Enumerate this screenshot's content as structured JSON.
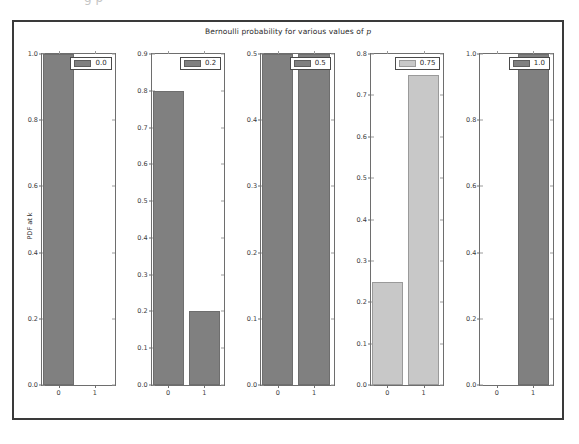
{
  "figure": {
    "title_prefix": "Bernoulli probability for various values of ",
    "title_italic": "p",
    "ylabel": "PDF at k",
    "clipped_top_text": "g p",
    "frame_color": "#3a3a3a",
    "axis_color": "#6e6e6e",
    "bar_color_dark": "#808080",
    "bar_color_light": "#c8c8c8",
    "background": "#ffffff"
  },
  "chart_data": {
    "type": "bar",
    "title": "Bernoulli probability for various values of p",
    "xlabel": "",
    "ylabel": "PDF at k",
    "grid": false,
    "legend_position": "upper right",
    "layout": "1 row x 5 columns of subplots",
    "categories": [
      "0",
      "1"
    ],
    "panels": [
      {
        "legend": "0.0",
        "p": 0.0,
        "categories": [
          "0",
          "1"
        ],
        "values": [
          1.0,
          0.0
        ],
        "ylim": [
          0.0,
          1.0
        ],
        "yticks": [
          "0.0",
          "0.2",
          "0.4",
          "0.6",
          "0.8",
          "1.0"
        ],
        "ytick_values": [
          0.0,
          0.2,
          0.4,
          0.6,
          0.8,
          1.0
        ],
        "xticks": [
          "0",
          "1"
        ],
        "bar_color": "#808080"
      },
      {
        "legend": "0.2",
        "p": 0.2,
        "categories": [
          "0",
          "1"
        ],
        "values": [
          0.8,
          0.2
        ],
        "ylim": [
          0.0,
          0.9
        ],
        "yticks": [
          "0.0",
          "0.1",
          "0.2",
          "0.3",
          "0.4",
          "0.5",
          "0.6",
          "0.7",
          "0.8",
          "0.9"
        ],
        "ytick_values": [
          0.0,
          0.1,
          0.2,
          0.3,
          0.4,
          0.5,
          0.6,
          0.7,
          0.8,
          0.9
        ],
        "xticks": [
          "0",
          "1"
        ],
        "bar_color": "#808080"
      },
      {
        "legend": "0.5",
        "p": 0.5,
        "categories": [
          "0",
          "1"
        ],
        "values": [
          0.5,
          0.5
        ],
        "ylim": [
          0.0,
          0.5
        ],
        "yticks": [
          "0.0",
          "0.1",
          "0.2",
          "0.3",
          "0.4",
          "0.5"
        ],
        "ytick_values": [
          0.0,
          0.1,
          0.2,
          0.3,
          0.4,
          0.5
        ],
        "xticks": [
          "0",
          "1"
        ],
        "bar_color": "#808080"
      },
      {
        "legend": "0.75",
        "p": 0.75,
        "categories": [
          "0",
          "1"
        ],
        "values": [
          0.25,
          0.75
        ],
        "ylim": [
          0.0,
          0.8
        ],
        "yticks": [
          "0.0",
          "0.1",
          "0.2",
          "0.3",
          "0.4",
          "0.5",
          "0.6",
          "0.7",
          "0.8"
        ],
        "ytick_values": [
          0.0,
          0.1,
          0.2,
          0.3,
          0.4,
          0.5,
          0.6,
          0.7,
          0.8
        ],
        "xticks": [
          "0",
          "1"
        ],
        "bar_color": "#c8c8c8"
      },
      {
        "legend": "1.0",
        "p": 1.0,
        "categories": [
          "0",
          "1"
        ],
        "values": [
          0.0,
          1.0
        ],
        "ylim": [
          0.0,
          1.0
        ],
        "yticks": [
          "0.0",
          "0.2",
          "0.4",
          "0.6",
          "0.8",
          "1.0"
        ],
        "ytick_values": [
          0.0,
          0.2,
          0.4,
          0.6,
          0.8,
          1.0
        ],
        "xticks": [
          "0",
          "1"
        ],
        "bar_color": "#808080"
      }
    ]
  }
}
